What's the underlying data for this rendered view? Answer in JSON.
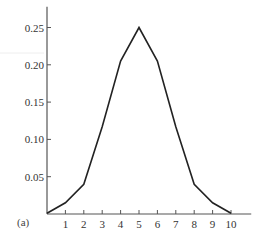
{
  "chart_data": {
    "type": "line",
    "title": "",
    "panel_label": "(a)",
    "xlabel": "",
    "ylabel": "",
    "x": [
      0,
      1,
      2,
      3,
      4,
      5,
      6,
      7,
      8,
      9,
      10
    ],
    "values": [
      0.001,
      0.015,
      0.04,
      0.117,
      0.205,
      0.25,
      0.205,
      0.117,
      0.04,
      0.015,
      0.001
    ],
    "x_ticks": [
      1,
      2,
      3,
      4,
      5,
      6,
      7,
      8,
      9,
      10
    ],
    "x_tick_labels": [
      "1",
      "2",
      "3",
      "4",
      "5",
      "6",
      "7",
      "8",
      "9",
      "10"
    ],
    "y_ticks": [
      0.05,
      0.1,
      0.15,
      0.2,
      0.25
    ],
    "y_tick_labels": [
      "0.05",
      "0.10",
      "0.15",
      "0.20",
      "0.25"
    ],
    "xlim": [
      0,
      11.1
    ],
    "ylim": [
      0,
      0.275
    ],
    "grid": false,
    "legend": null,
    "line_color": "#222222",
    "axis_color": "#555555"
  }
}
